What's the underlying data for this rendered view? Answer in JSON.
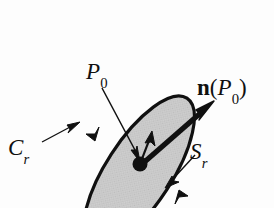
{
  "figure": {
    "caption_labels": {
      "point": {
        "base": "P",
        "subscript": "0"
      },
      "normal_vector": {
        "vector": "n",
        "open_paren": "(",
        "base": "P",
        "subscript": "0",
        "close_paren": ")"
      },
      "boundary_curve": {
        "base": "C",
        "subscript": "r"
      },
      "surface": {
        "base": "S",
        "subscript": "r"
      }
    },
    "colors": {
      "background": "#fdfdfd",
      "surface_fill": "#cbcbcb",
      "outline": "#101010",
      "label_text": "#101010",
      "leader_line": "#101010"
    },
    "geometry": {
      "ellipse": {
        "center_x": 139,
        "center_y": 172,
        "radius_x": 88,
        "radius_y": 33,
        "rotation_deg": -57
      },
      "point_p0": {
        "x": 140,
        "y": 164
      },
      "normal_arrow": {
        "from_x": 140,
        "from_y": 164,
        "to_x": 213,
        "to_y": 101
      }
    }
  }
}
